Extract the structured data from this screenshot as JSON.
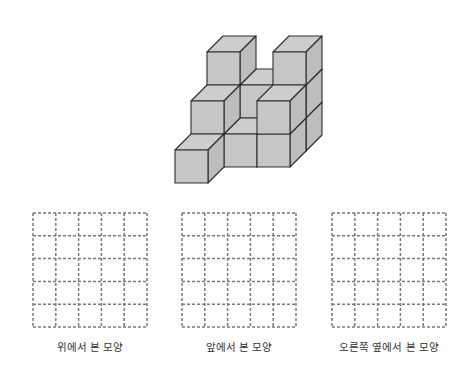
{
  "figure": {
    "cube_structure": {
      "description": "Stacked unit cubes in oblique projection",
      "cube_size_px": 33,
      "depth_offset_px": [
        16,
        -16
      ],
      "origin_px": [
        175,
        150
      ],
      "fill_front": "#c6c6c6",
      "fill_top": "#cdcdcd",
      "fill_side": "#bdbdbd",
      "stroke": "#2e2e2e",
      "cubes": [
        {
          "c": 0,
          "r": 2,
          "h": 0
        },
        {
          "c": 1,
          "r": 2,
          "h": 0
        },
        {
          "c": 2,
          "r": 2,
          "h": 0
        },
        {
          "c": 0,
          "r": 2,
          "h": 1
        },
        {
          "c": 1,
          "r": 2,
          "h": 1
        },
        {
          "c": 2,
          "r": 2,
          "h": 1
        },
        {
          "c": 0,
          "r": 2,
          "h": 2
        },
        {
          "c": 2,
          "r": 2,
          "h": 2
        },
        {
          "c": 0,
          "r": 1,
          "h": 0
        },
        {
          "c": 1,
          "r": 1,
          "h": 0
        },
        {
          "c": 2,
          "r": 1,
          "h": 0
        },
        {
          "c": 0,
          "r": 1,
          "h": 1
        },
        {
          "c": 2,
          "r": 1,
          "h": 1
        },
        {
          "c": 0,
          "r": 0,
          "h": 0
        }
      ]
    },
    "grids": [
      {
        "id": "top-view",
        "x": 32,
        "rows": 5,
        "cols": 5,
        "label": "위에서 본 모양",
        "label_x": 90
      },
      {
        "id": "front-view",
        "x": 181,
        "rows": 5,
        "cols": 5,
        "label": "앞에서 본 모양",
        "label_x": 239
      },
      {
        "id": "right-view",
        "x": 331,
        "rows": 5,
        "cols": 5,
        "label": "오른쪽 옆에서 본 모양",
        "label_x": 389
      }
    ],
    "grid_style": {
      "dash_color": "#7a7a7a"
    }
  }
}
